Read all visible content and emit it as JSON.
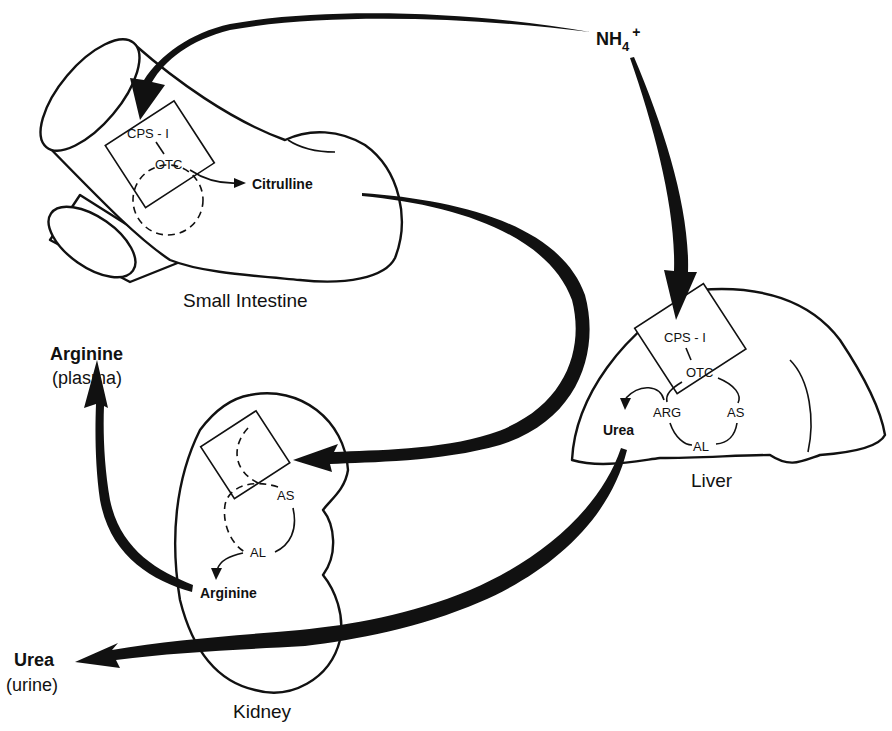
{
  "diagram": {
    "type": "metabolic pathway (inter-organ urea/arginine synthesis)",
    "source": {
      "ammonium": {
        "main": "NH",
        "sub": "4",
        "sup": "+"
      }
    },
    "organs": {
      "small_intestine": {
        "label": "Small Intestine",
        "enzymes": [
          "CPS - I",
          "OTC"
        ],
        "product": "Citrulline"
      },
      "liver": {
        "label": "Liver",
        "enzymes": [
          "CPS - I",
          "OTC",
          "ARG",
          "AS",
          "AL"
        ],
        "product": "Urea"
      },
      "kidney": {
        "label": "Kidney",
        "enzymes": [
          "AS",
          "AL"
        ],
        "product": "Arginine"
      }
    },
    "outputs": {
      "arginine": {
        "label": "Arginine",
        "sublabel": "(plasma)"
      },
      "urea": {
        "label": "Urea",
        "sublabel": "(urine)"
      }
    },
    "flows": [
      {
        "from": "NH4+",
        "to": "Small Intestine"
      },
      {
        "from": "NH4+",
        "to": "Liver"
      },
      {
        "from": "Small Intestine (Citrulline)",
        "to": "Kidney"
      },
      {
        "from": "Kidney (Arginine)",
        "to": "Arginine (plasma)"
      },
      {
        "from": "Liver (Urea)",
        "to": "Urea (urine)"
      }
    ]
  }
}
